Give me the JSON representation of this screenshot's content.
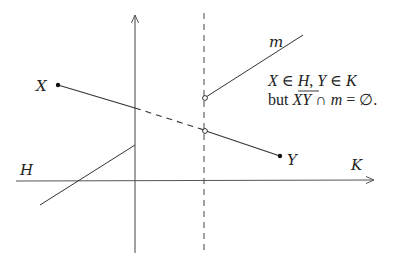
{
  "diagram": {
    "labels": {
      "X": "X",
      "Y": "Y",
      "H": "H",
      "K": "K",
      "m": "m"
    },
    "annotation": {
      "line1": {
        "X": "X",
        "in1": " ∈ ",
        "H": "H",
        "comma": ", ",
        "Y": "Y",
        "in2": " ∈ ",
        "K": "K"
      },
      "line2": {
        "but": "but ",
        "XY": "XY",
        "cap": " ∩ ",
        "m": "m",
        "eq": " = ∅."
      }
    },
    "colors": {
      "stroke": "#333333",
      "axis": "#555555",
      "text": "#222222"
    }
  }
}
